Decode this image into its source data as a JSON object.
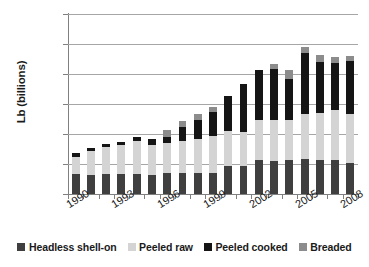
{
  "chart_data": {
    "type": "bar",
    "subtype": "stacked-vertical",
    "title": "",
    "xlabel": "",
    "ylabel": "Lb (billions)",
    "ylim": [
      0,
      3
    ],
    "ytick_labels": [
      "0",
      "0.5",
      "1",
      "1.5",
      "2",
      "2.5",
      "3"
    ],
    "ytick_values": [
      0,
      0.5,
      1,
      1.5,
      2,
      2.5,
      3
    ],
    "grid": true,
    "grid_axis": "y",
    "legend_position": "bottom",
    "x": [
      1990,
      1991,
      1992,
      1993,
      1994,
      1995,
      1996,
      1997,
      1998,
      1999,
      2000,
      2001,
      2002,
      2003,
      2004,
      2005,
      2006,
      2007,
      2008
    ],
    "categories": [
      "1990",
      "1991",
      "1992",
      "1993",
      "1994",
      "1995",
      "1996",
      "1997",
      "1998",
      "1999",
      "2000",
      "2001",
      "2002",
      "2003",
      "2004",
      "2005",
      "2006",
      "2007",
      "2008"
    ],
    "visible_xtick_labels": [
      "1990",
      "1993",
      "1996",
      "1999",
      "2002",
      "2005",
      "2008"
    ],
    "series": [
      {
        "name": "Headless shell-on",
        "color": "#3f3f3f",
        "values": [
          0.33,
          0.31,
          0.33,
          0.34,
          0.34,
          0.32,
          0.35,
          0.35,
          0.35,
          0.35,
          0.46,
          0.47,
          0.56,
          0.55,
          0.57,
          0.59,
          0.56,
          0.56,
          0.51
        ]
      },
      {
        "name": "Peeled raw",
        "color": "#d4d4d4",
        "values": [
          0.29,
          0.41,
          0.46,
          0.47,
          0.54,
          0.5,
          0.5,
          0.54,
          0.56,
          0.61,
          0.59,
          0.57,
          0.67,
          0.69,
          0.66,
          0.74,
          0.79,
          0.84,
          0.82
        ]
      },
      {
        "name": "Peeled cooked",
        "color": "#151515",
        "values": [
          0.06,
          0.05,
          0.05,
          0.06,
          0.07,
          0.1,
          0.1,
          0.22,
          0.33,
          0.41,
          0.58,
          0.8,
          0.84,
          0.85,
          0.69,
          1.02,
          0.85,
          0.79,
          0.89
        ]
      },
      {
        "name": "Breaded",
        "color": "#8c8c8c",
        "values": [
          0.0,
          0.0,
          0.0,
          0.0,
          0.0,
          0.0,
          0.12,
          0.11,
          0.09,
          0.08,
          0.0,
          0.0,
          0.0,
          0.07,
          0.14,
          0.1,
          0.11,
          0.1,
          0.08
        ]
      }
    ],
    "totals": [
      0.68,
      0.77,
      0.84,
      0.87,
      0.95,
      0.92,
      0.95,
      1.08,
      1.23,
      1.34,
      1.45,
      1.63,
      1.84,
      2.08,
      2.17,
      2.45,
      2.31,
      2.29,
      2.3
    ]
  },
  "legend": {
    "items": [
      {
        "label": "Headless shell-on",
        "color": "#3f3f3f"
      },
      {
        "label": "Peeled raw",
        "color": "#d4d4d4"
      },
      {
        "label": "Peeled cooked",
        "color": "#151515"
      },
      {
        "label": "Breaded",
        "color": "#8c8c8c"
      }
    ]
  },
  "colors": {
    "axis": "#808080",
    "gridline": "#a6a6a6",
    "text": "#1a1a1a",
    "background": "#ffffff"
  }
}
